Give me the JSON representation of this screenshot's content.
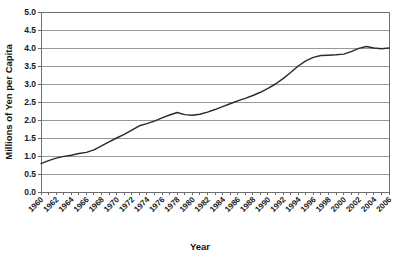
{
  "chart_data": {
    "type": "line",
    "title": "",
    "xlabel": "Year",
    "ylabel": "Millions of Yen per Capita",
    "xlim": [
      1960,
      2006
    ],
    "ylim": [
      0.0,
      5.0
    ],
    "grid": true,
    "legend": "none",
    "y_ticks": [
      "0.0",
      "0.5",
      "1.0",
      "1.5",
      "2.0",
      "2.5",
      "3.0",
      "3.5",
      "4.0",
      "4.5",
      "5.0"
    ],
    "y_tick_values": [
      0.0,
      0.5,
      1.0,
      1.5,
      2.0,
      2.5,
      3.0,
      3.5,
      4.0,
      4.5,
      5.0
    ],
    "x_ticks": [
      "1960",
      "1962",
      "1964",
      "1966",
      "1968",
      "1970",
      "1972",
      "1974",
      "1976",
      "1978",
      "1980",
      "1982",
      "1984",
      "1986",
      "1988",
      "1990",
      "1992",
      "1994",
      "1996",
      "1998",
      "2000",
      "2002",
      "2004",
      "2006"
    ],
    "x_tick_values": [
      1960,
      1962,
      1964,
      1966,
      1968,
      1970,
      1972,
      1974,
      1976,
      1978,
      1980,
      1982,
      1984,
      1986,
      1988,
      1990,
      1992,
      1994,
      1996,
      1998,
      2000,
      2002,
      2004,
      2006
    ],
    "x": [
      1960,
      1961,
      1962,
      1963,
      1964,
      1965,
      1966,
      1967,
      1968,
      1969,
      1970,
      1971,
      1972,
      1973,
      1974,
      1975,
      1976,
      1977,
      1978,
      1979,
      1980,
      1981,
      1982,
      1983,
      1984,
      1985,
      1986,
      1987,
      1988,
      1989,
      1990,
      1991,
      1992,
      1993,
      1994,
      1995,
      1996,
      1997,
      1998,
      1999,
      2000,
      2001,
      2002,
      2003,
      2004,
      2005,
      2006
    ],
    "values": [
      0.79,
      0.87,
      0.94,
      0.99,
      1.02,
      1.07,
      1.1,
      1.17,
      1.28,
      1.39,
      1.5,
      1.6,
      1.72,
      1.84,
      1.9,
      1.97,
      2.06,
      2.14,
      2.21,
      2.15,
      2.13,
      2.16,
      2.22,
      2.29,
      2.37,
      2.45,
      2.53,
      2.6,
      2.68,
      2.77,
      2.88,
      3.0,
      3.15,
      3.32,
      3.5,
      3.64,
      3.74,
      3.79,
      3.8,
      3.81,
      3.83,
      3.9,
      3.99,
      4.04,
      4.0,
      3.98,
      4.0
    ],
    "series_color": "#2b2b2b",
    "gridline_color": "#8c8c8c",
    "frame_color": "#6e6e6e",
    "plot_background": "#ffffff"
  }
}
